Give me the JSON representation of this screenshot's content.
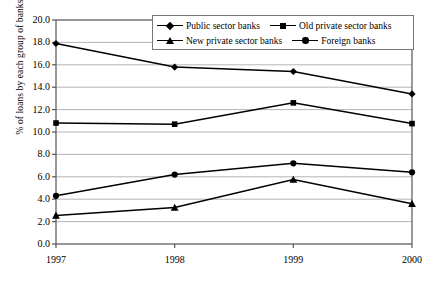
{
  "chart_data": {
    "type": "line",
    "title": "",
    "subtitle": "",
    "xlabel": "",
    "ylabel": "% of loans by each group of banks",
    "categories": [
      "1997",
      "1998",
      "1999",
      "2000"
    ],
    "x": [
      1997,
      1998,
      1999,
      2000
    ],
    "xlim": [
      1997,
      2000
    ],
    "ylim": [
      0.0,
      20.0
    ],
    "ytick_labels": [
      "0.0",
      "2.0",
      "4.0",
      "6.0",
      "8.0",
      "10.0",
      "12.0",
      "14.0",
      "16.0",
      "18.0",
      "20.0"
    ],
    "yticks": [
      0.0,
      2.0,
      4.0,
      6.0,
      8.0,
      10.0,
      12.0,
      14.0,
      16.0,
      18.0,
      20.0
    ],
    "xtick_labels": [
      "1997",
      "1998",
      "1999",
      "2000"
    ],
    "grid": true,
    "grid_axis": "y",
    "legend_position": "top-right",
    "series": [
      {
        "name": "Public sector banks",
        "marker": "diamond",
        "color": "#000000",
        "values": [
          17.9,
          15.8,
          15.4,
          13.4
        ]
      },
      {
        "name": "Old private sector banks",
        "marker": "square",
        "color": "#000000",
        "values": [
          10.8,
          10.7,
          12.6,
          10.75
        ]
      },
      {
        "name": "New private sector banks",
        "marker": "triangle",
        "color": "#000000",
        "values": [
          2.55,
          3.25,
          5.75,
          3.6
        ]
      },
      {
        "name": "Foreign banks",
        "marker": "circle",
        "color": "#000000",
        "values": [
          4.3,
          6.2,
          7.2,
          6.4
        ]
      }
    ],
    "colors": {
      "line": "#000000",
      "grid": "#b5b5b5",
      "axis": "#555555",
      "background": "#ffffff"
    }
  }
}
